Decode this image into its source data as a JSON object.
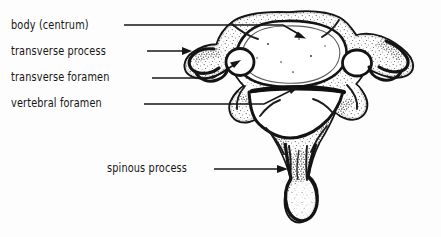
{
  "figure": {
    "view": "superior",
    "style": "black-and-white ink line drawing with stipple shading",
    "background_color": "#fdfdfd",
    "ink_color": "#161616"
  },
  "labels": [
    {
      "id": "body-centrum",
      "text": "body (centrum)",
      "leader": "horizontal line ending in arrowhead inside the vertebral body",
      "target": "vertebral body"
    },
    {
      "id": "transverse-process",
      "text": "transverse process",
      "leader": "horizontal line ending in arrowhead at the left transverse process tip",
      "target": "left transverse process"
    },
    {
      "id": "transverse-foramen",
      "text": "transverse foramen",
      "leader": "horizontal line angling up-right into the left transverse foramen",
      "target": "left transverse foramen"
    },
    {
      "id": "vertebral-foramen",
      "text": "vertebral foramen",
      "leader": "horizontal line angling up-right into the vertebral foramen",
      "target": "vertebral foramen"
    },
    {
      "id": "spinous-process",
      "text": "spinous process",
      "leader": "horizontal line ending in arrowhead at the spinous process shaft",
      "target": "spinous process"
    }
  ]
}
